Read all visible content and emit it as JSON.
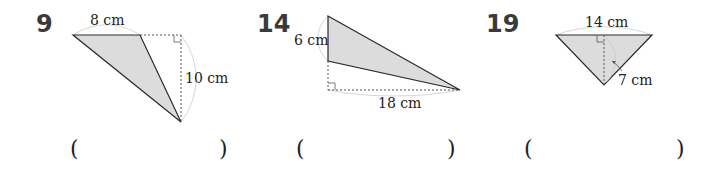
{
  "problems": [
    {
      "number": "9",
      "labels": {
        "top": "8 cm",
        "side": "10 cm"
      },
      "answer_open": "(",
      "answer_close": ")",
      "answer_value": ""
    },
    {
      "number": "14",
      "labels": {
        "side": "6 cm",
        "bottom": "18 cm"
      },
      "answer_open": "(",
      "answer_close": ")",
      "answer_value": ""
    },
    {
      "number": "19",
      "labels": {
        "top": "14 cm",
        "height": "7 cm"
      },
      "answer_open": "(",
      "answer_close": ")",
      "answer_value": ""
    }
  ],
  "colors": {
    "fill": "#dcdcdc",
    "stroke": "#2a2a2a",
    "dashed": "#555555",
    "arc": "#cfcfcf"
  }
}
